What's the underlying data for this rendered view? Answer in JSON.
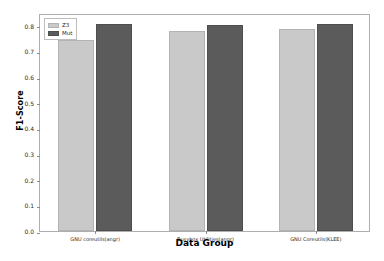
{
  "chart_data": {
    "type": "bar",
    "title": "",
    "xlabel": "Data Group",
    "ylabel": "F1-Score",
    "categories": [
      "GNU coreutils(angr)",
      "Busybox Utilities(angr)",
      "GNU Coreutils(KLEE)"
    ],
    "series": [
      {
        "name": "Z3",
        "color": "#c9c9c9",
        "values": [
          0.744,
          0.778,
          0.789
        ]
      },
      {
        "name": "Mut",
        "color": "#5b5b5b",
        "values": [
          0.806,
          0.802,
          0.806
        ]
      }
    ],
    "ylim": [
      0.0,
      0.85
    ],
    "yticks": [
      0.0,
      0.1,
      0.2,
      0.3,
      0.4,
      0.5,
      0.6,
      0.7,
      0.8
    ],
    "ytick_labels": [
      "0.0",
      "0.1",
      "0.2",
      "0.3",
      "0.4",
      "0.5",
      "0.6",
      "0.7",
      "0.8"
    ],
    "grid": false,
    "legend_position": "upper left"
  }
}
